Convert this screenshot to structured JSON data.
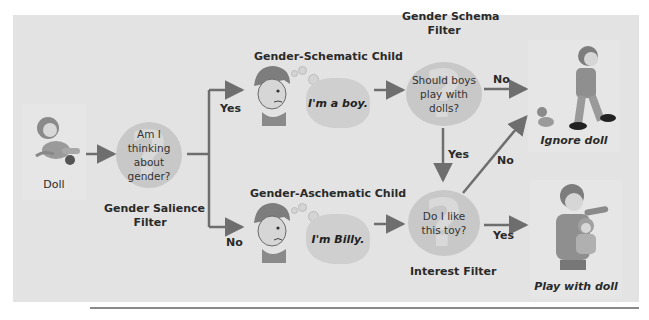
{
  "diagram": {
    "start": {
      "label": "Doll",
      "icon": "doll-icon"
    },
    "gender_salience_filter": {
      "question": "Am I thinking about gender?",
      "question_lines": [
        "Am I thinking",
        "about gender?"
      ],
      "caption_lines": [
        "Gender Salience",
        "Filter"
      ]
    },
    "branches": {
      "yes_label": "Yes",
      "no_label": "No"
    },
    "schematic_child": {
      "title": "Gender-Schematic Child",
      "thought": "I'm a boy.",
      "icon": "boy-face-icon"
    },
    "aschematic_child": {
      "title": "Gender-Aschematic Child",
      "thought": "I'm Billy.",
      "icon": "boy-face-icon"
    },
    "gender_schema_filter": {
      "caption_lines": [
        "Gender Schema",
        "Filter"
      ],
      "question_lines": [
        "Should boys",
        "play with dolls?"
      ],
      "no_label": "No",
      "yes_label": "Yes"
    },
    "interest_filter": {
      "caption": "Interest Filter",
      "question_lines": [
        "Do I like",
        "this toy?"
      ],
      "no_label": "No",
      "yes_label": "Yes"
    },
    "outcomes": {
      "ignore": {
        "label": "Ignore doll",
        "icon": "boy-walking-away-icon"
      },
      "play": {
        "label": "Play with doll",
        "icon": "boy-holding-doll-icon"
      }
    },
    "colors": {
      "panel": "#e3e3e3",
      "arrow": "#6e6e6e",
      "filter_circle": "#c8c8c8",
      "text": "#2a2a2a"
    }
  }
}
